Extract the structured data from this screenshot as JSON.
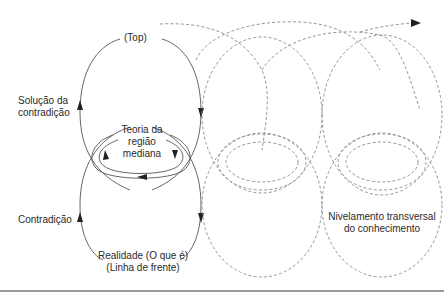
{
  "diagram": {
    "labels": {
      "top": "(Top)",
      "solution_line1": "Solução da",
      "solution_line2": "contradição",
      "theory_line1": "Teoria da",
      "theory_line2": "região",
      "theory_line3": "mediana",
      "contradiction": "Contradição",
      "reality_line1": "Realidade (O que é)",
      "reality_line2": "(Linha de frente)",
      "leveling_line1": "Nivelamento transversal",
      "leveling_line2": "do conhecimento"
    },
    "colors": {
      "solid_stroke": "#555555",
      "dashed_stroke": "#8a8a8a",
      "arrowhead": "#222222",
      "text": "#2a2a2a",
      "rule": "#9a9a9a"
    }
  }
}
